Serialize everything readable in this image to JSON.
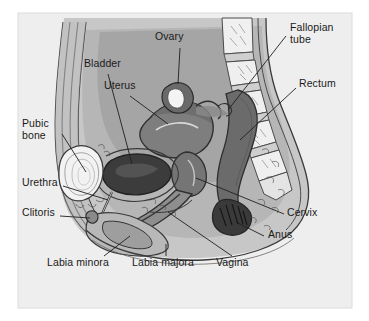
{
  "figure": {
    "panel_background": "#eeeeee",
    "page_background": "#ffffff",
    "ink_color": "#1a1a1a",
    "tones": {
      "body_light": "#c9c9c9",
      "body_mid": "#b4b4b4",
      "body_dark": "#9a9a9a",
      "organ_dark": "#6e6e6e",
      "organ_darker": "#5a5a5a",
      "bone_white": "#f2f2f2",
      "cavity_black": "#2e2e2e"
    }
  },
  "labels": [
    {
      "id": "ovary",
      "text": "Ovary",
      "x": 155,
      "y": 36,
      "align": "left"
    },
    {
      "id": "fallopian",
      "text": "Fallopian",
      "x": 290,
      "y": 27,
      "align": "left"
    },
    {
      "id": "fallopian2",
      "text": "tube",
      "x": 290,
      "y": 39,
      "align": "left"
    },
    {
      "id": "bladder",
      "text": "Bladder",
      "x": 84,
      "y": 63,
      "align": "left"
    },
    {
      "id": "uterus",
      "text": "Uterus",
      "x": 104,
      "y": 85,
      "align": "left"
    },
    {
      "id": "rectum",
      "text": "Rectum",
      "x": 299,
      "y": 83,
      "align": "left"
    },
    {
      "id": "pubic",
      "text": "Pubic",
      "x": 22,
      "y": 123,
      "align": "left"
    },
    {
      "id": "pubic2",
      "text": "bone",
      "x": 22,
      "y": 135,
      "align": "left"
    },
    {
      "id": "urethra",
      "text": "Urethra",
      "x": 22,
      "y": 182,
      "align": "left"
    },
    {
      "id": "clitoris",
      "text": "Clitoris",
      "x": 22,
      "y": 212,
      "align": "left"
    },
    {
      "id": "cervix",
      "text": "Cervix",
      "x": 287,
      "y": 212,
      "align": "left"
    },
    {
      "id": "anus",
      "text": "Anus",
      "x": 268,
      "y": 234,
      "align": "left"
    },
    {
      "id": "labia-minora",
      "text": "Labia minora",
      "x": 47,
      "y": 262,
      "align": "left"
    },
    {
      "id": "labia-majora",
      "text": "Labia majora",
      "x": 132,
      "y": 262,
      "align": "left"
    },
    {
      "id": "vagina",
      "text": "Vagina",
      "x": 216,
      "y": 262,
      "align": "left"
    }
  ]
}
